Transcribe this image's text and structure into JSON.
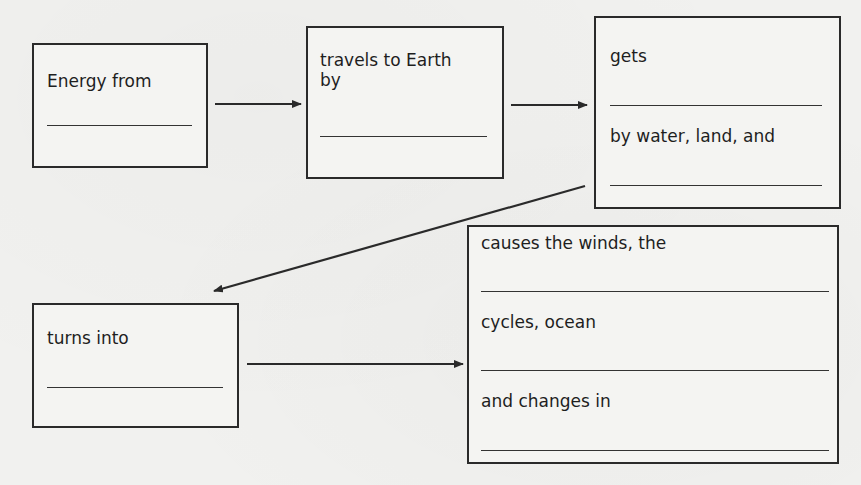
{
  "diagram": {
    "type": "flowchart",
    "nodes": [
      {
        "id": "box1",
        "lines": [
          "Energy from"
        ],
        "blanks": 1
      },
      {
        "id": "box2",
        "lines": [
          "travels to Earth",
          "by"
        ],
        "blanks": 1
      },
      {
        "id": "box3",
        "lines": [
          "gets",
          "by water, land, and"
        ],
        "blanks": 2
      },
      {
        "id": "box4",
        "lines": [
          "turns into"
        ],
        "blanks": 1
      },
      {
        "id": "box5",
        "lines": [
          "causes the winds, the",
          "cycles, ocean",
          "and changes in"
        ],
        "blanks": 3
      }
    ],
    "edges": [
      {
        "from": "box1",
        "to": "box2"
      },
      {
        "from": "box2",
        "to": "box3"
      },
      {
        "from": "box3",
        "to": "box4"
      },
      {
        "from": "box4",
        "to": "box5"
      }
    ]
  },
  "box1": {
    "line1": "Energy from"
  },
  "box2": {
    "line1": "travels to Earth",
    "line2": "by"
  },
  "box3": {
    "line1": "gets",
    "line2": "by water, land, and"
  },
  "box4": {
    "line1": "turns into"
  },
  "box5": {
    "line1": "causes the winds, the",
    "line2": "cycles, ocean",
    "line3": "and changes in"
  },
  "colors": {
    "stroke": "#2a2a2a",
    "paper": "#f1f1ef",
    "text": "#1e1e1e"
  }
}
